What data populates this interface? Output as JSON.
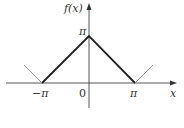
{
  "diagram": {
    "axes": {
      "y_label": "f(x)",
      "x_label": "x",
      "origin_label": "0",
      "y_tick_label": "π",
      "x_tick_labels": [
        "−π",
        "π"
      ]
    },
    "function": {
      "description": "f(x) = π − |x| on [−π, π], extended periodically",
      "main_segment_points": [
        [
          -3.14159,
          0
        ],
        [
          0,
          3.14159
        ],
        [
          3.14159,
          0
        ]
      ],
      "extension_left": [
        [
          -3.14159,
          0
        ],
        [
          -4.2,
          1.1
        ]
      ],
      "extension_right": [
        [
          3.14159,
          0
        ],
        [
          4.2,
          1.1
        ]
      ]
    },
    "colors": {
      "axis": "#444444",
      "main_line": "#222222",
      "extension_line": "#777777"
    }
  }
}
